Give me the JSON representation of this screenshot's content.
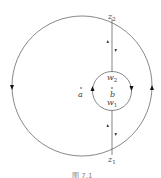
{
  "diagram": {
    "labels": {
      "z2": "z",
      "z2_sub": "2",
      "z1": "z",
      "z1_sub": "1",
      "w2": "w",
      "w2_sub": "2",
      "w1": "w",
      "w1_sub": "1",
      "a": "a",
      "b": "b"
    },
    "caption": "图 7.1",
    "colors": {
      "stroke": "#333333",
      "text": "#444444"
    }
  }
}
